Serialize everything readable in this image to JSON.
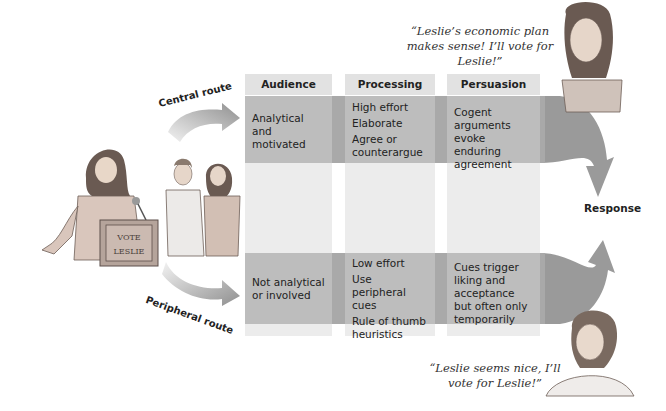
{
  "diagram": {
    "columns": [
      {
        "id": "audience",
        "label": "Audience"
      },
      {
        "id": "processing",
        "label": "Processing"
      },
      {
        "id": "persuasion",
        "label": "Persuasion"
      }
    ],
    "central_route": {
      "label": "Central route",
      "audience": "Analytical and motivated",
      "processing": [
        "High effort",
        "Elaborate",
        "Agree or counterargue"
      ],
      "persuasion": "Cogent arguments evoke enduring agreement"
    },
    "peripheral_route": {
      "label": "Peripheral route",
      "audience": "Not analytical or involved",
      "processing": [
        "Low effort",
        "Use peripheral cues",
        "Rule of thumb heuristics"
      ],
      "persuasion": "Cues trigger liking and acceptance but often only temporarily"
    },
    "outcome_label": "Response",
    "quotes": {
      "central": "“Leslie’s economic plan makes sense! I’ll vote for Leslie!”",
      "peripheral": "“Leslie seems nice, I’ll vote for Leslie!”"
    },
    "podium_sign": {
      "line1": "VOTE",
      "line2": "LESLIE"
    },
    "illustrations": [
      "speaker-at-podium",
      "audience-pair",
      "central-listener",
      "peripheral-listener"
    ],
    "colors": {
      "band": "#a9a9a9",
      "cell": "#bdbdbd",
      "header": "#e2e2e2",
      "column_fill": "#ececec",
      "arrow": "#9a9a9a"
    }
  }
}
